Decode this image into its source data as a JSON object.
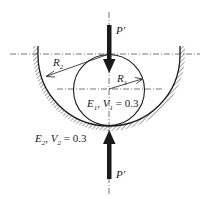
{
  "diagram": {
    "type": "contact-mechanics",
    "colors": {
      "line": "#1a1a1a",
      "background": "#ffffff"
    },
    "labels": {
      "load_top": {
        "symbol": "P",
        "prime": "′"
      },
      "load_bottom": {
        "symbol": "P",
        "prime": "′"
      },
      "radius_outer": {
        "symbol": "R",
        "sub": "2"
      },
      "radius_inner": {
        "symbol": "R",
        "sub": "1"
      },
      "ball_material": {
        "E": "E",
        "E_sub": "1",
        "sep": ", ",
        "nu": "V",
        "nu_sub": "1",
        "eq": " = 0.3"
      },
      "seat_material": {
        "E": "E",
        "E_sub": "2",
        "sep": ", ",
        "nu": "V",
        "nu_sub": "2",
        "eq": " = 0.3"
      }
    }
  }
}
